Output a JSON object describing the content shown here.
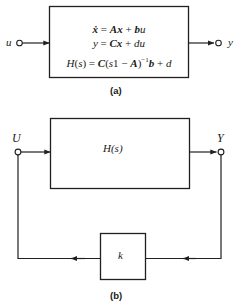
{
  "figure": {
    "panels": [
      {
        "id": "a",
        "caption": "(a)",
        "input_label": "u",
        "output_label": "y",
        "equations": [
          "ẋ = Ax + bu",
          "y = Cx + du",
          "H(s) = C(s1 − A)⁻¹b + d"
        ]
      },
      {
        "id": "b",
        "caption": "(b)",
        "input_label": "U",
        "output_label": "Y",
        "forward_block_label": "H(s)",
        "feedback_block_label": "k"
      }
    ]
  },
  "colors": {
    "line": "#231f20",
    "background": "#ffffff",
    "text": "#1a1a1a"
  }
}
